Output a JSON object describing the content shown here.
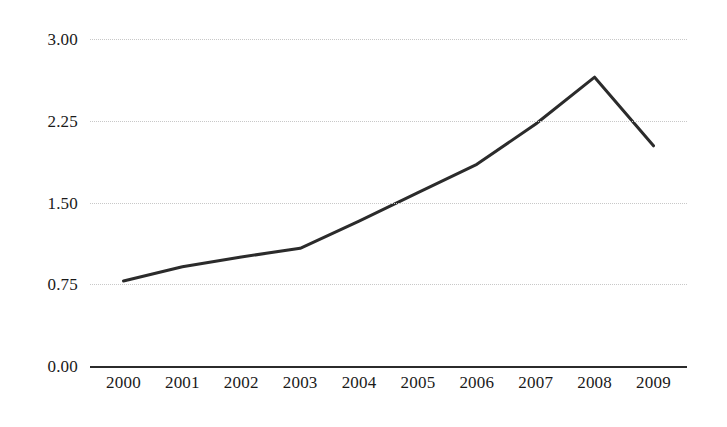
{
  "chart_data": {
    "type": "line",
    "title": "",
    "subtitle": "",
    "xlabel": "",
    "ylabel": "",
    "categories": [
      "2000",
      "2001",
      "2002",
      "2003",
      "2004",
      "2005",
      "2006",
      "2007",
      "2008",
      "2009"
    ],
    "x": [
      2000,
      2001,
      2002,
      2003,
      2004,
      2005,
      2006,
      2007,
      2008,
      2009
    ],
    "series": [
      {
        "name": "",
        "values": [
          0.78,
          0.91,
          1.0,
          1.08,
          1.33,
          1.59,
          1.85,
          2.22,
          2.65,
          2.02
        ],
        "color": "#2b2b2b",
        "line_width": 3,
        "markers": false
      }
    ],
    "ylim": [
      0.0,
      3.0
    ],
    "ytick_values": [
      0.0,
      0.75,
      1.5,
      2.25,
      3.0
    ],
    "ytick_labels": [
      "0.00",
      "0.75",
      "1.50",
      "2.25",
      "3.00"
    ],
    "grid": true,
    "grid_style": "dotted",
    "grid_color": "#c8c8c8",
    "axis_zero_color": "#2b2b2b",
    "legend": false,
    "legend_position": "none",
    "annotations": [],
    "background_color": "#ffffff"
  }
}
